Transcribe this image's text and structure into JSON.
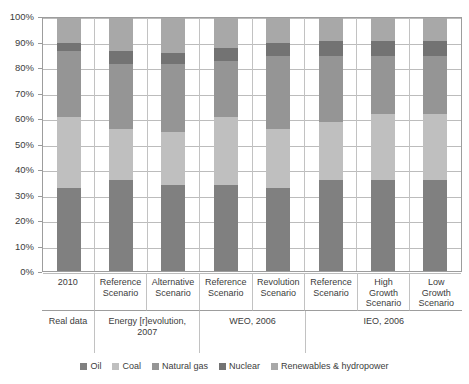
{
  "chart_data": {
    "type": "bar",
    "subtype": "stacked-100-percent",
    "title": "",
    "xlabel": "",
    "ylabel": "",
    "ylim": [
      0,
      100
    ],
    "grid": true,
    "legend_position": "bottom",
    "y_ticks": [
      "0%",
      "10%",
      "20%",
      "30%",
      "40%",
      "50%",
      "60%",
      "70%",
      "80%",
      "90%",
      "100%"
    ],
    "categories": [
      "2010",
      "Reference Scenario",
      "Alternative Scenario",
      "Reference Scenario",
      "Revolution Scenario",
      "Reference Scenario",
      "High Growth Scenario",
      "Low Growth Scenario"
    ],
    "category_lines": [
      [
        "2010"
      ],
      [
        "Reference",
        "Scenario"
      ],
      [
        "Alternative",
        "Scenario"
      ],
      [
        "Reference",
        "Scenario"
      ],
      [
        "Revolution",
        "Scenario"
      ],
      [
        "Reference",
        "Scenario"
      ],
      [
        "High",
        "Growth",
        "Scenario"
      ],
      [
        "Low",
        "Growth",
        "Scenario"
      ]
    ],
    "groups": [
      {
        "label": "Real data",
        "label_lines": [
          "Real data"
        ],
        "span": 1
      },
      {
        "label": "Energy [r]evolution, 2007",
        "label_lines": [
          "Energy [r]evolution,",
          "2007"
        ],
        "span": 2
      },
      {
        "label": "WEO, 2006",
        "label_lines": [
          "WEO, 2006"
        ],
        "span": 2
      },
      {
        "label": "IEO, 2006",
        "label_lines": [
          "IEO, 2006"
        ],
        "span": 3
      }
    ],
    "series": [
      {
        "name": "Oil",
        "color": "#808080",
        "values": [
          33,
          36,
          34,
          34,
          33,
          36,
          36,
          36
        ]
      },
      {
        "name": "Coal",
        "color": "#bfbfbf",
        "values": [
          28,
          20,
          21,
          27,
          23,
          23,
          26,
          26
        ]
      },
      {
        "name": "Natural gas",
        "color": "#959595",
        "values": [
          26,
          26,
          27,
          22,
          29,
          26,
          23,
          23
        ]
      },
      {
        "name": "Nuclear",
        "color": "#737373",
        "values": [
          3,
          5,
          4,
          5,
          5,
          6,
          6,
          6
        ]
      },
      {
        "name": "Renewables & hydropower",
        "color": "#a8a8a8",
        "values": [
          10,
          13,
          14,
          12,
          10,
          9,
          9,
          9
        ]
      }
    ]
  },
  "legend": {
    "items": [
      {
        "label": "Oil",
        "color": "#808080"
      },
      {
        "label": "Coal",
        "color": "#bfbfbf"
      },
      {
        "label": "Natural gas",
        "color": "#959595"
      },
      {
        "label": "Nuclear",
        "color": "#737373"
      },
      {
        "label": "Renewables & hydropower",
        "color": "#a8a8a8"
      }
    ]
  }
}
